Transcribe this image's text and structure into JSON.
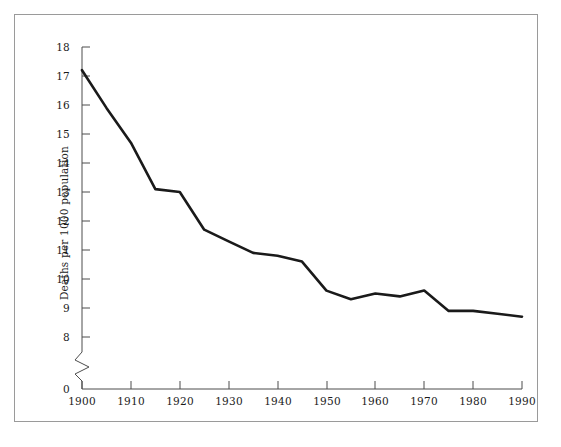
{
  "figure": {
    "background_color": "#ffffff",
    "frame_color": "#9a9a9a",
    "line_color": "#1a1a1a",
    "axis_color": "#4d4d4d"
  },
  "axes": {
    "ylabel": "Deaths per 1000 population",
    "xlabel": "",
    "y_ticks": [
      "0",
      "8",
      "9",
      "10",
      "11",
      "12",
      "13",
      "14",
      "15",
      "16",
      "17",
      "18"
    ],
    "x_ticks": [
      "1900",
      "1910",
      "1920",
      "1930",
      "1940",
      "1950",
      "1960",
      "1970",
      "1980",
      "1990"
    ],
    "axis_break": "zigzag"
  },
  "chart_data": {
    "type": "line",
    "title": "",
    "xlabel": "",
    "ylabel": "Deaths per 1000 population",
    "xlim": [
      1900,
      1990
    ],
    "ylim": [
      8,
      18
    ],
    "y_axis_broken_below": 8,
    "grid": false,
    "legend": "none",
    "x": [
      1900,
      1905,
      1910,
      1915,
      1920,
      1925,
      1930,
      1935,
      1940,
      1945,
      1950,
      1955,
      1960,
      1965,
      1970,
      1975,
      1980,
      1985,
      1990
    ],
    "values": [
      17.2,
      15.9,
      14.7,
      13.1,
      13.0,
      11.7,
      11.3,
      10.9,
      10.8,
      10.6,
      9.6,
      9.3,
      9.5,
      9.4,
      9.6,
      8.9,
      8.9,
      8.8,
      8.7
    ],
    "series": [
      {
        "name": "Death rate",
        "values": [
          17.2,
          15.9,
          14.7,
          13.1,
          13.0,
          11.7,
          11.3,
          10.9,
          10.8,
          10.6,
          9.6,
          9.3,
          9.5,
          9.4,
          9.6,
          8.9,
          8.9,
          8.8,
          8.7
        ]
      }
    ]
  }
}
